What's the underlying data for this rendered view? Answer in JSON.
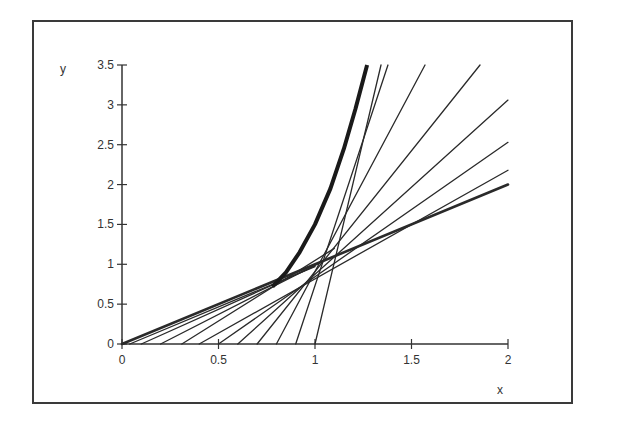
{
  "chart_data": {
    "type": "line",
    "title": "",
    "xlabel": "x",
    "ylabel": "y",
    "xlim": [
      0,
      2
    ],
    "ylim": [
      0,
      3.5
    ],
    "grid": false,
    "legend": null,
    "x_ticks": [
      0,
      0.5,
      1,
      1.5,
      2
    ],
    "x_tick_labels": [
      "0",
      "0.5",
      "1",
      "1.5",
      "2"
    ],
    "y_ticks": [
      0,
      0.5,
      1,
      1.5,
      2,
      2.5,
      3,
      3.5
    ],
    "y_tick_labels": [
      "0",
      "0.5",
      "1",
      "1.5",
      "2",
      "2.5",
      "3",
      "3.5"
    ],
    "curve": {
      "name": "envelope curve",
      "style": "thick",
      "points": [
        [
          0.78,
          0.72
        ],
        [
          0.85,
          0.9
        ],
        [
          0.92,
          1.15
        ],
        [
          1.0,
          1.5
        ],
        [
          1.08,
          1.95
        ],
        [
          1.15,
          2.45
        ],
        [
          1.21,
          2.95
        ],
        [
          1.27,
          3.5
        ]
      ]
    },
    "series": [
      {
        "name": "line 1",
        "x": [
          1.0,
          1.342
        ],
        "y": [
          0,
          3.5
        ],
        "style": "thin"
      },
      {
        "name": "line 2",
        "x": [
          0.9,
          1.378
        ],
        "y": [
          0,
          3.5
        ],
        "style": "thin"
      },
      {
        "name": "line 3",
        "x": [
          0.8,
          1.57
        ],
        "y": [
          0,
          3.5
        ],
        "style": "thin"
      },
      {
        "name": "line 4",
        "x": [
          0.7,
          1.855
        ],
        "y": [
          0,
          3.5
        ],
        "style": "thin"
      },
      {
        "name": "line 5",
        "x": [
          0.6,
          2.0
        ],
        "y": [
          0,
          3.06
        ],
        "style": "thin"
      },
      {
        "name": "line 6",
        "x": [
          0.5,
          2.0
        ],
        "y": [
          0,
          2.53
        ],
        "style": "thin"
      },
      {
        "name": "line 7",
        "x": [
          0.4,
          2.0
        ],
        "y": [
          0,
          2.18
        ],
        "style": "thin"
      },
      {
        "name": "line 8",
        "x": [
          0.31,
          1.1
        ],
        "y": [
          0,
          1.2
        ],
        "style": "thin"
      },
      {
        "name": "line 9",
        "x": [
          0.2,
          1.05
        ],
        "y": [
          0,
          1.05
        ],
        "style": "thin"
      },
      {
        "name": "line 10",
        "x": [
          0.1,
          1.0
        ],
        "y": [
          0,
          0.98
        ],
        "style": "thin"
      },
      {
        "name": "line 11",
        "x": [
          0.04,
          1.0
        ],
        "y": [
          0,
          0.97
        ],
        "style": "thin"
      },
      {
        "name": "line 12",
        "x": [
          0.0,
          2.0
        ],
        "y": [
          0,
          2.0
        ],
        "style": "thick"
      }
    ]
  }
}
